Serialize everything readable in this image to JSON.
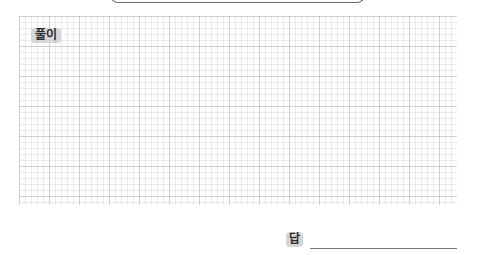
{
  "worksheet": {
    "solution_label": "풀이",
    "answer_label": "답",
    "answer_value": "",
    "colors": {
      "badge_bg": "#d6d6d6",
      "badge_text": "#2a2a2a",
      "grid_line": "#c8c8c8",
      "answer_line": "#777777"
    }
  }
}
